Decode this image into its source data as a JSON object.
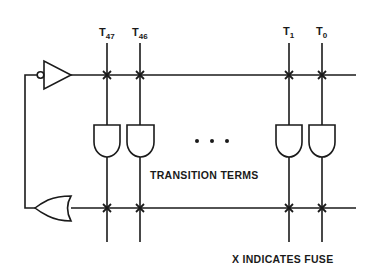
{
  "diagram": {
    "type": "logic-circuit",
    "columns": [
      {
        "label": "T",
        "subscript": "47",
        "x": 107
      },
      {
        "label": "T",
        "subscript": "46",
        "x": 140
      },
      {
        "label": "T",
        "subscript": "1",
        "x": 289
      },
      {
        "label": "T",
        "subscript": "0",
        "x": 322
      }
    ],
    "ellipsis": "• • •",
    "and_gates_label": "TRANSITION TERMS",
    "legend": "X INDICATES FUSE",
    "components": {
      "top_gate": "inverting buffer",
      "bottom_gate": "OR gate",
      "and_gates": 4,
      "fuse_marker": "x"
    },
    "colors": {
      "line": "#1a1a1a",
      "background": "#ffffff"
    }
  }
}
